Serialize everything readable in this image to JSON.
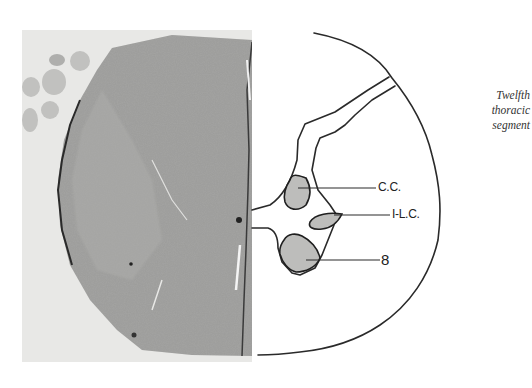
{
  "figure": {
    "photo": {
      "description": "Photomicrograph of spinal cord cross-section (left half), grayscale stained tissue"
    },
    "diagram": {
      "labels": [
        {
          "id": "cc",
          "text": "C.C."
        },
        {
          "id": "ilc",
          "text": "I-L.C."
        },
        {
          "id": "eight",
          "text": "8"
        }
      ]
    },
    "caption": {
      "lines": [
        "Twelfth",
        "thoracic",
        "segment"
      ]
    }
  }
}
